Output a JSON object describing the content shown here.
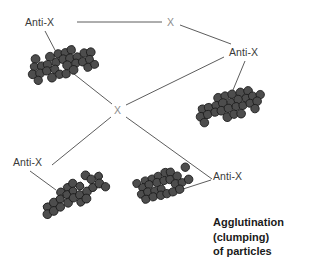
{
  "figure": {
    "kind": "immunology-diagram",
    "background_color": "#ffffff",
    "line_color": "#4a4a4a",
    "label_color": "#3a3a3a",
    "antigen_label_color": "#8d8d8d",
    "particle_fill": "#4d4d4d",
    "particle_stroke": "#1a1a1a"
  },
  "labels": {
    "antibody_top_left": "Anti-X",
    "antigen_top": "X",
    "antibody_right": "Anti-X",
    "antigen_center": "X",
    "antibody_bottom_left": "Anti-X",
    "antibody_bottom_right": "Anti-X"
  },
  "caption": {
    "line1": "Agglutination",
    "line2": "(clumping)",
    "line3": "of particles"
  },
  "clumps": [
    {
      "name": "clump-top-left",
      "cx": 60,
      "cy": 64,
      "rot": -15,
      "cols": 9,
      "rows": 4,
      "r": 4.2
    },
    {
      "name": "clump-right",
      "cx": 228,
      "cy": 106,
      "rot": -14,
      "cols": 9,
      "rows": 4,
      "r": 4.2
    },
    {
      "name": "clump-bottom-left",
      "cx": 72,
      "cy": 196,
      "rot": -32,
      "cols": 9,
      "rows": 4,
      "r": 4.2
    },
    {
      "name": "clump-bottom-center",
      "cx": 164,
      "cy": 184,
      "rot": -18,
      "cols": 8,
      "rows": 4,
      "r": 4.0
    }
  ],
  "connectors": [
    {
      "name": "link-antix-topleft-to-x-top",
      "x1": 77,
      "y1": 22,
      "x2": 162,
      "y2": 22
    },
    {
      "name": "link-x-top-to-antix-right",
      "x1": 180,
      "y1": 25,
      "x2": 231,
      "y2": 44
    },
    {
      "name": "link-x-center-to-topleft",
      "x1": 112,
      "y1": 104,
      "x2": 74,
      "y2": 74
    },
    {
      "name": "link-x-center-to-right",
      "x1": 126,
      "y1": 105,
      "x2": 224,
      "y2": 57
    },
    {
      "name": "link-x-center-to-bottomleft",
      "x1": 111,
      "y1": 117,
      "x2": 52,
      "y2": 165
    },
    {
      "name": "link-x-center-to-bottomright",
      "x1": 126,
      "y1": 117,
      "x2": 212,
      "y2": 179
    },
    {
      "name": "leader-antix-topleft",
      "x1": 45,
      "y1": 31,
      "x2": 56,
      "y2": 52
    },
    {
      "name": "leader-antix-right",
      "x1": 245,
      "y1": 61,
      "x2": 233,
      "y2": 90
    },
    {
      "name": "leader-antix-bottomleft",
      "x1": 30,
      "y1": 171,
      "x2": 56,
      "y2": 190
    },
    {
      "name": "leader-antix-bottomright",
      "x1": 211,
      "y1": 180,
      "x2": 180,
      "y2": 190
    }
  ]
}
